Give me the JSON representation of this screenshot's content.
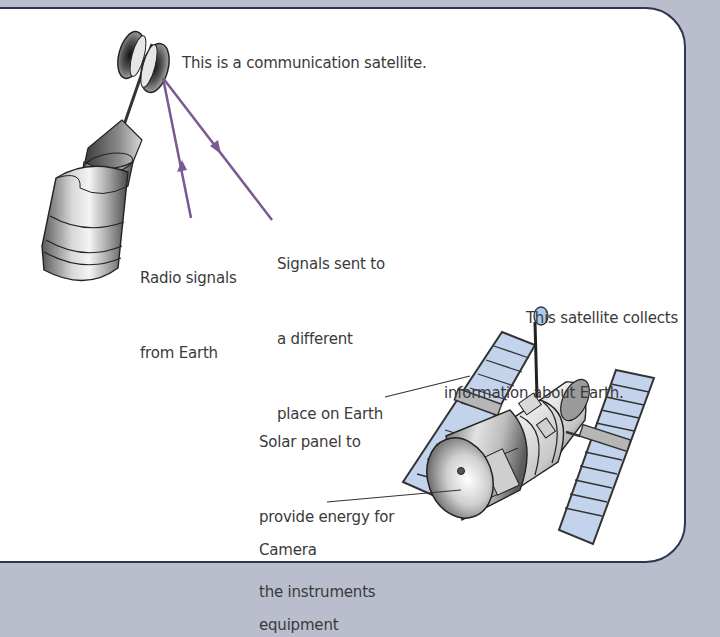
{
  "diagram": {
    "communication_satellite": {
      "caption": "This is a communication satellite.",
      "signal_in_label": [
        "Radio signals",
        "from Earth"
      ],
      "signal_out_label": [
        "Signals sent to",
        "a different",
        "place on Earth"
      ]
    },
    "observation_satellite": {
      "caption": [
        "This satellite collects",
        "information about Earth."
      ],
      "solar_panel_label": [
        "Solar panel to",
        "provide energy for",
        "the instruments"
      ],
      "camera_label": [
        "Camera",
        "equipment"
      ]
    },
    "colors": {
      "background": "#b9bdcc",
      "panel": "#ffffff",
      "panel_border": "#2f3550",
      "signal_line": "#7a5a92",
      "solar_cell": "#c3d3ec",
      "antenna_dish": "#a9cdf0",
      "text": "#3a3a3a"
    }
  }
}
